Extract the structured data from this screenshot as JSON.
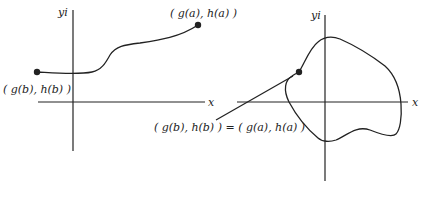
{
  "left_graph": {
    "y_axis_label": "yi",
    "x_axis_label": "x",
    "start_point_label": "( g(b), h(b) )",
    "end_point_label": "( g(a), h(a) )"
  },
  "right_graph": {
    "y_axis_label": "yi",
    "x_axis_label": "x",
    "closed_curve_point_label": "( g(b), h(b) ) = ( g(a), h(a) )"
  },
  "colors": {
    "ink": "#222222",
    "background": "#ffffff"
  }
}
